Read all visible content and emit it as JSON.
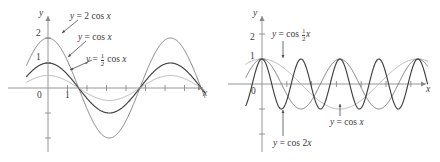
{
  "figure": {
    "background": "#ffffff",
    "ink": "#3b3b3b",
    "axis_color": "#8a8a8a",
    "width": 440,
    "height": 162
  },
  "panels": [
    {
      "id": "left",
      "name": "amplitude-panel",
      "axes": {
        "x_label": "x",
        "y_label": "y",
        "y_ticks": [
          "2",
          "1"
        ],
        "x_ticks": [
          "0",
          "1"
        ],
        "x_range": [
          -1.1,
          8.6
        ],
        "y_range": [
          -2.6,
          2.6
        ],
        "grid": false
      },
      "curves": [
        {
          "name": "y-equals-2-cos-x",
          "label": "y = 2 cos x",
          "amplitude": 2,
          "frequency": 1,
          "color": "#777777",
          "width": 0.9
        },
        {
          "name": "y-equals-cos-x",
          "label": "y = cos x",
          "amplitude": 1,
          "frequency": 1,
          "color": "#3f3f3f",
          "width": 1.15
        },
        {
          "name": "y-equals-half-cos-x",
          "label": "y = 1/2 cos x",
          "amplitude": 0.5,
          "frequency": 1,
          "color": "#a9a9a9",
          "width": 0.85
        }
      ],
      "annotations": [
        {
          "name": "label-2cosx",
          "lhs": "y",
          "eq": "=",
          "coef": "2",
          "fn": "cos",
          "arg": "x"
        },
        {
          "name": "label-cosx",
          "lhs": "y",
          "eq": "=",
          "coef": "",
          "fn": "cos",
          "arg": "x"
        },
        {
          "name": "label-halfcosx",
          "lhs": "y",
          "eq": "=",
          "num": "1",
          "den": "2",
          "fn": "cos",
          "arg": "x"
        }
      ]
    },
    {
      "id": "right",
      "name": "period-panel",
      "axes": {
        "x_label": "x",
        "y_label": "y",
        "y_ticks": [
          "2",
          "1"
        ],
        "x_ticks": [
          "0"
        ],
        "x_range": [
          -1.3,
          14.2
        ],
        "y_range": [
          -2.6,
          2.6
        ],
        "grid": false
      },
      "curves": [
        {
          "name": "y-equals-cos-half-x",
          "label": "y = cos 1/2 x",
          "amplitude": 1,
          "frequency": 0.5,
          "color": "#a9a9a9",
          "width": 0.85
        },
        {
          "name": "y-equals-cos-x",
          "label": "y = cos x",
          "amplitude": 1,
          "frequency": 1,
          "color": "#777777",
          "width": 0.95
        },
        {
          "name": "y-equals-cos-2x",
          "label": "y = cos 2x",
          "amplitude": 1,
          "frequency": 2,
          "color": "#3f3f3f",
          "width": 1.15
        }
      ],
      "annotations": [
        {
          "name": "label-cos-half-x",
          "lhs": "y",
          "eq": "=",
          "fn": "cos",
          "num": "1",
          "den": "2",
          "arg": "x"
        },
        {
          "name": "label-cos-x",
          "lhs": "y",
          "eq": "=",
          "fn": "cos",
          "arg": "x"
        },
        {
          "name": "label-cos-2x",
          "lhs": "y",
          "eq": "=",
          "fn": "cos",
          "coef": "2",
          "arg": "x"
        }
      ]
    }
  ],
  "chart_data": {
    "type": "line",
    "xlabel": "x",
    "ylabel": "y",
    "panel_count": 2,
    "panels": [
      {
        "subtitle": "Amplitude variation",
        "xlim": [
          -1.1,
          8.6
        ],
        "ylim": [
          -2.6,
          2.6
        ],
        "xticks": [
          0,
          1,
          2,
          3,
          4,
          5,
          6,
          7,
          8
        ],
        "xticklabels": [
          "0",
          "1",
          "",
          "",
          "",
          "",
          "",
          "",
          ""
        ],
        "yticks": [
          -2,
          -1,
          1,
          2
        ],
        "yticklabels": [
          "",
          "",
          "1",
          "2"
        ],
        "grid": false,
        "legend": "inline-annotations",
        "series": [
          {
            "name": "y = 2 cos x",
            "formula": "2*cos(x)",
            "amplitude": 2,
            "period": 6.2832,
            "color": "#777777"
          },
          {
            "name": "y = cos x",
            "formula": "cos(x)",
            "amplitude": 1,
            "period": 6.2832,
            "color": "#3f3f3f"
          },
          {
            "name": "y = 1/2 cos x",
            "formula": "0.5*cos(x)",
            "amplitude": 0.5,
            "period": 6.2832,
            "color": "#a9a9a9"
          }
        ]
      },
      {
        "subtitle": "Period variation",
        "xlim": [
          -1.3,
          14.2
        ],
        "ylim": [
          -2.6,
          2.6
        ],
        "xticks": [
          0,
          2,
          4,
          6,
          8,
          10,
          12,
          14
        ],
        "xticklabels": [
          "0",
          "",
          "",
          "",
          "",
          "",
          "",
          ""
        ],
        "yticks": [
          -2,
          -1,
          1,
          2
        ],
        "yticklabels": [
          "",
          "",
          "1",
          "2"
        ],
        "grid": false,
        "legend": "inline-annotations",
        "series": [
          {
            "name": "y = cos 1/2 x",
            "formula": "cos(0.5*x)",
            "amplitude": 1,
            "period": 12.5664,
            "color": "#a9a9a9"
          },
          {
            "name": "y = cos x",
            "formula": "cos(x)",
            "amplitude": 1,
            "period": 6.2832,
            "color": "#777777"
          },
          {
            "name": "y = cos 2x",
            "formula": "cos(2*x)",
            "amplitude": 1,
            "period": 3.1416,
            "color": "#3f3f3f"
          }
        ]
      }
    ]
  }
}
